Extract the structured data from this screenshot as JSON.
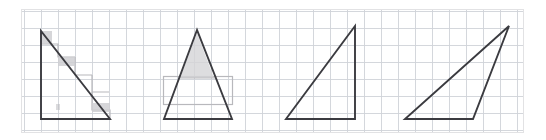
{
  "figure": {
    "canvas": {
      "width": 546,
      "height": 140,
      "background": "#ffffff"
    },
    "panel": {
      "label": "grid-paper-panel",
      "x": 21,
      "y": 9,
      "width": 503,
      "height": 124,
      "border_color": "#e2e2e4",
      "fill": "#ffffff"
    },
    "grid": {
      "label": "graph-paper-grid",
      "cell_size": 17,
      "origin_x": 24,
      "origin_y": 11,
      "line_color": "#cfd2d8",
      "line_width": 0.9,
      "visible": true
    },
    "stroke": {
      "shape_color": "#3b3b40",
      "shape_width": 1.9,
      "annotation_color": "#b8b8bc",
      "annotation_width": 1.2
    },
    "shapes": [
      {
        "name": "triangle-1-right-obtuse-left",
        "type": "triangle",
        "description": "right triangle, right angle at bottom-left, vertical leg on left",
        "points": "41,31 41,119 110,119",
        "base_units": 4,
        "height_units": 5
      },
      {
        "name": "triangle-2-isosceles",
        "type": "triangle",
        "description": "isosceles triangle, apex centred above horizontal base",
        "points": "197,30 164,119 232,119",
        "base_units": 4,
        "height_units": 5
      },
      {
        "name": "triangle-3-right-angle-bottom-right",
        "type": "triangle",
        "description": "right triangle, right angle at bottom-right, vertical leg on right",
        "points": "355,26 286,119 355,119",
        "base_units": 4,
        "height_units": 5.5
      },
      {
        "name": "triangle-4-scalene-obtuse",
        "type": "triangle",
        "description": "scalene triangle, apex far right above the base, long shallow top-left edge",
        "points": "509,26 405,119 473,119",
        "base_units": 4,
        "height_units": 5.5
      }
    ],
    "annotations": [
      {
        "name": "annotation-staircase-steps",
        "belongs_to": "triangle-1-right-obtuse-left",
        "type": "polyline-steps",
        "description": "faint pencil staircase steps traced under the hypotenuse",
        "segments": [
          "41,31 41,44 51,44",
          "51,44 58,44 58,57 75,57",
          "75,57 75,75 92,75",
          "92,75 92,92 109,92",
          "92,92 92,110 110,110 110,119"
        ]
      },
      {
        "name": "annotation-shaded-corner-1",
        "belongs_to": "triangle-1-right-obtuse-left",
        "type": "shaded-cell",
        "description": "faint shaded square at the apex corner",
        "rect": {
          "x": 41,
          "y": 31,
          "width": 11,
          "height": 13
        },
        "fill": "#cfcfd2"
      },
      {
        "name": "annotation-shaded-cell-mid",
        "belongs_to": "triangle-1-right-obtuse-left",
        "type": "shaded-cell",
        "description": "faint shaded square midway along the hypotenuse",
        "rect": {
          "x": 58,
          "y": 57,
          "width": 17,
          "height": 9
        },
        "fill": "#cfcfd2"
      },
      {
        "name": "annotation-shaded-cell-low",
        "belongs_to": "triangle-1-right-obtuse-left",
        "type": "shaded-cell",
        "description": "faint shaded square near the bottom of the hypotenuse",
        "rect": {
          "x": 92,
          "y": 103,
          "width": 18,
          "height": 9
        },
        "fill": "#cfcfd2"
      },
      {
        "name": "annotation-bounding-rectangle",
        "belongs_to": "triangle-2-isosceles",
        "type": "rectangle",
        "description": "faint pencil rectangle drawn across the lower half of the isosceles triangle",
        "rect": {
          "x": 163,
          "y": 76,
          "width": 69,
          "height": 28
        }
      },
      {
        "name": "annotation-apex-shading",
        "belongs_to": "triangle-2-isosceles",
        "type": "shaded-region",
        "description": "faint shading filling the upper part of the isosceles triangle above the rectangle",
        "points": "197,33 180,78 214,78",
        "fill": "#d4d4d7"
      },
      {
        "name": "annotation-apex-cap-line",
        "belongs_to": "triangle-2-isosceles",
        "type": "line",
        "description": "faint horizontal pencil line capping the shaded apex region",
        "x1": 178,
        "y1": 78,
        "x2": 216,
        "y2": 78
      }
    ],
    "smudges": [
      {
        "name": "smudge-mark-left",
        "x": 56,
        "y": 104,
        "width": 4,
        "height": 6
      }
    ]
  }
}
